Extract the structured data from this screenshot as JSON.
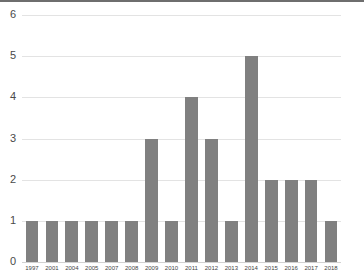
{
  "chart_data": {
    "type": "bar",
    "title": "",
    "subtitle": "",
    "xlabel": "",
    "ylabel": "",
    "categories": [
      "1997",
      "2001",
      "2004",
      "2005",
      "2007",
      "2008",
      "2009",
      "2010",
      "2011",
      "2012",
      "2013",
      "2014",
      "2015",
      "2016",
      "2017",
      "2018"
    ],
    "values": [
      1,
      1,
      1,
      1,
      1,
      1,
      3,
      1,
      4,
      3,
      1,
      5,
      2,
      2,
      2,
      1
    ],
    "ylim": [
      0,
      6
    ],
    "yticks": [
      "0",
      "1",
      "2",
      "3",
      "4",
      "5",
      "6"
    ],
    "ytick_values": [
      0,
      1,
      2,
      3,
      4,
      5,
      6
    ],
    "grid": true,
    "grid_axis": "y",
    "legend": false,
    "legend_position": "none",
    "annotations": []
  },
  "style": {
    "bar_color": "#808080",
    "gridline_color": "#e3e3e3",
    "baseline_color": "#d2d2d2",
    "top_rule_color": "#6e6e6e",
    "tick_label_color": "#4a4a4a",
    "background_color": "#ffffff"
  }
}
